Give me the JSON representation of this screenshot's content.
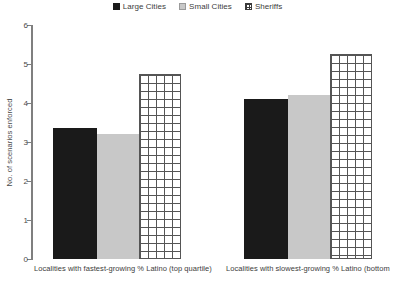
{
  "chart_data": {
    "type": "bar",
    "title": "",
    "xlabel": "",
    "ylabel": "No. of scenarios enforced",
    "ylim": [
      0,
      6
    ],
    "ytick_labels": [
      "0",
      "1",
      "2",
      "3",
      "4",
      "5",
      "6"
    ],
    "yticks": [
      0,
      1,
      2,
      3,
      4,
      5,
      6
    ],
    "grid": false,
    "legend_position": "top-center",
    "categories": [
      "Localities with fastest-growing % Latino (top quartile)",
      "Localities with slowest-growing % Latino (bottom"
    ],
    "series": [
      {
        "name": "Large Cities",
        "values": [
          3.35,
          4.1
        ],
        "color": "#1a1a1a",
        "fill": "solid-dark"
      },
      {
        "name": "Small Cities",
        "values": [
          3.2,
          4.2
        ],
        "color": "#c8c8c8",
        "fill": "solid-gray"
      },
      {
        "name": "Sheriffs",
        "values": [
          4.75,
          5.25
        ],
        "color": "#ffffff",
        "fill": "grid-fill"
      }
    ]
  },
  "legend": {
    "items": [
      {
        "label": "Large Cities",
        "swatch": "solid-dark"
      },
      {
        "label": "Small Cities",
        "swatch": "solid-gray"
      },
      {
        "label": "Sheriffs",
        "swatch": "grid-fill"
      }
    ]
  },
  "axis": {
    "y_title": "No. of scenarios enforced",
    "y_ticks": [
      "6",
      "5",
      "4",
      "3",
      "2",
      "1",
      "0"
    ]
  },
  "category_labels": [
    "Localities with fastest-growing % Latino (top quartile)",
    "Localities with slowest-growing % Latino (bottom"
  ]
}
